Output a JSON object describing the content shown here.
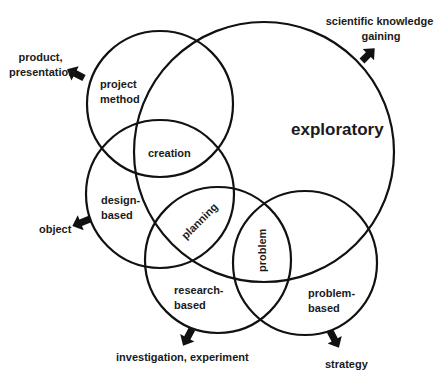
{
  "colors": {
    "stroke": "#111111",
    "text": "#1a1a1a",
    "background": "#ffffff"
  },
  "circles": {
    "project_method": {
      "label_lines": [
        "project",
        "method"
      ]
    },
    "exploratory": {
      "label": "exploratory"
    },
    "design_based": {
      "label_lines": [
        "design-",
        "based"
      ]
    },
    "research_based": {
      "label_lines": [
        "research-",
        "based"
      ]
    },
    "problem_based": {
      "label_lines": [
        "problem-",
        "based"
      ]
    }
  },
  "intersections": {
    "creation": "creation",
    "planning": "planning",
    "problem": "problem"
  },
  "outputs": {
    "project_method": [
      "product,",
      "presentation"
    ],
    "exploratory": [
      "scientific knowledge",
      "gaining"
    ],
    "design_based": [
      "object"
    ],
    "research_based": [
      "investigation, experiment"
    ],
    "problem_based": [
      "strategy"
    ]
  }
}
